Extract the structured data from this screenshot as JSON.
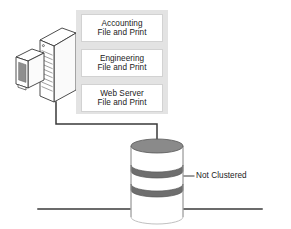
{
  "diagram": {
    "colors": {
      "panel_background": "#e3e3e3",
      "box_background": "#ffffff",
      "box_border": "#d2d2d2",
      "line": "#3a3a3a",
      "text": "#222222",
      "disk_band": "#6e6e6e",
      "disk_top": "#8a8a8a",
      "monitor_screen": "#8f8f8f"
    },
    "server": {
      "name": "server-tower",
      "monitor_name": "server-monitor"
    },
    "services": [
      {
        "title": "Accounting",
        "subtitle": "File and Print"
      },
      {
        "title": "Engineering",
        "subtitle": "File and Print"
      },
      {
        "title": "Web Server",
        "subtitle": "File and Print"
      }
    ],
    "storage": {
      "name": "disk-stack",
      "segments": 3,
      "label": "Not Clustered"
    },
    "connector": {
      "name": "server-to-storage-link"
    },
    "network_bus": {
      "name": "network-bus-line"
    }
  }
}
